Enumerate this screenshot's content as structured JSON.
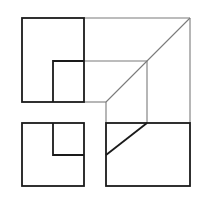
{
  "diagram": {
    "type": "orthographic-projection",
    "colors": {
      "visible_edge": "#1a1a1a",
      "projection_line": "#7a7a7a",
      "background": "#ffffff"
    },
    "views": [
      {
        "name": "front-view",
        "outer": [
          22,
          18,
          84,
          102
        ],
        "inner": [
          53,
          61,
          84,
          102
        ]
      },
      {
        "name": "left-view",
        "outer": [
          22,
          123,
          84,
          186
        ],
        "inner": [
          53,
          123,
          84,
          155
        ]
      },
      {
        "name": "top-view",
        "outer": [
          106,
          123,
          190,
          186
        ],
        "diagonal": [
          [
            106,
            155
          ],
          [
            147,
            123
          ]
        ]
      }
    ],
    "projection_lines": {
      "top_edge": [
        [
          84,
          18
        ],
        [
          190,
          18
        ]
      ],
      "right_edge": [
        [
          190,
          18
        ],
        [
          190,
          123
        ]
      ],
      "miter_line": [
        [
          190,
          18
        ],
        [
          106,
          102
        ]
      ],
      "inner_top": [
        [
          84,
          61
        ],
        [
          147,
          61
        ]
      ],
      "inner_right": [
        [
          147,
          61
        ],
        [
          147,
          123
        ]
      ],
      "bottom_connector": [
        [
          84,
          102
        ],
        [
          106,
          102
        ]
      ],
      "vertical_connector": [
        [
          106,
          102
        ],
        [
          106,
          123
        ]
      ]
    }
  }
}
